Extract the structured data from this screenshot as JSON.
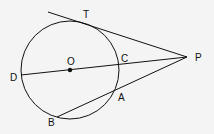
{
  "diagram": {
    "type": "geometry",
    "labels": {
      "T": "T",
      "P": "P",
      "O": "O",
      "C": "C",
      "D": "D",
      "A": "A",
      "B": "B"
    },
    "colors": {
      "stroke": "#111111",
      "background": "#f4f4f4"
    }
  }
}
